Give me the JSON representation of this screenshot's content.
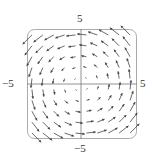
{
  "chart_data": {
    "type": "vector_field",
    "title": "",
    "field": "F(x, y) = <-y, x>",
    "rotation": "counterclockwise",
    "xlabel": "",
    "ylabel": "",
    "xlim": [
      -5,
      5
    ],
    "ylim": [
      -5,
      5
    ],
    "tick_labels": {
      "x_min": "−5",
      "x_max": "5",
      "y_min": "−5",
      "y_max": "5"
    },
    "grid": false,
    "frame": "rounded-rectangle",
    "sample_points": [
      -4.5,
      -3.5,
      -2.5,
      -1.5,
      -0.5,
      0.5,
      1.5,
      2.5,
      3.5,
      4.5
    ],
    "arrow_scale": 0.19,
    "colors": {
      "arrow": "#444444",
      "axis": "#777777",
      "frame": "#aaaaaa"
    }
  },
  "labels": {
    "y_top": "5",
    "y_bottom": "−5",
    "x_left": "−5",
    "x_right": "5"
  }
}
